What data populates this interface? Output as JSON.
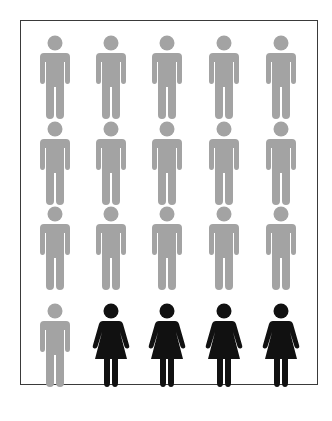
{
  "pictogram": {
    "rows": 4,
    "columns": 5,
    "total": 20,
    "colors": {
      "male": "#a3a3a3",
      "female": "#111111",
      "frame": "#3a3a3a",
      "background": "#ffffff"
    },
    "figures": [
      {
        "icon": "male-figure-icon",
        "color": "male"
      },
      {
        "icon": "male-figure-icon",
        "color": "male"
      },
      {
        "icon": "male-figure-icon",
        "color": "male"
      },
      {
        "icon": "male-figure-icon",
        "color": "male"
      },
      {
        "icon": "male-figure-icon",
        "color": "male"
      },
      {
        "icon": "male-figure-icon",
        "color": "male"
      },
      {
        "icon": "male-figure-icon",
        "color": "male"
      },
      {
        "icon": "male-figure-icon",
        "color": "male"
      },
      {
        "icon": "male-figure-icon",
        "color": "male"
      },
      {
        "icon": "male-figure-icon",
        "color": "male"
      },
      {
        "icon": "male-figure-icon",
        "color": "male"
      },
      {
        "icon": "male-figure-icon",
        "color": "male"
      },
      {
        "icon": "male-figure-icon",
        "color": "male"
      },
      {
        "icon": "male-figure-icon",
        "color": "male"
      },
      {
        "icon": "male-figure-icon",
        "color": "male"
      },
      {
        "icon": "male-figure-icon",
        "color": "male"
      },
      {
        "icon": "female-figure-icon",
        "color": "female"
      },
      {
        "icon": "female-figure-icon",
        "color": "female"
      },
      {
        "icon": "female-figure-icon",
        "color": "female"
      },
      {
        "icon": "female-figure-icon",
        "color": "female"
      }
    ],
    "counts": {
      "male": 16,
      "female": 4
    }
  }
}
